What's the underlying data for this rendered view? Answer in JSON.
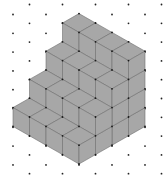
{
  "diagram": {
    "type": "isometric-solid",
    "colors": {
      "background": "#ffffff",
      "face_fill": "#a7a7a7",
      "edge_stroke": "#6e6e6e",
      "vertex_dot": "#1a1a1a",
      "grid_dot": "#222222"
    },
    "grid": {
      "x0": 13,
      "x_step": 16.5,
      "columns": 10,
      "y_step": 18.8,
      "even_col_y0": 14.5,
      "odd_col_y0": 4.5,
      "rows": 10
    },
    "projection": {
      "origin": [
        79,
        164
      ],
      "a_vector": [
        -16.5,
        -9.4
      ],
      "b_vector": [
        16.5,
        -9.4
      ],
      "h_vector": [
        0,
        -18.8
      ]
    },
    "solid": {
      "depth_a": 4,
      "step_heights": [
        1,
        2,
        3,
        4
      ],
      "cube_count": 40
    }
  }
}
